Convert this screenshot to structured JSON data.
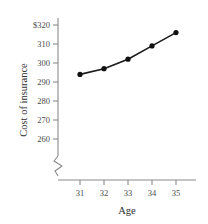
{
  "chart_data": {
    "type": "line",
    "title": "",
    "xlabel": "Age",
    "ylabel": "Cost of insurance",
    "x": [
      31,
      32,
      33,
      34,
      35
    ],
    "categories": [
      "31",
      "32",
      "33",
      "34",
      "35"
    ],
    "values": [
      294,
      297,
      302,
      309,
      316
    ],
    "series": [
      {
        "name": "Cost of insurance",
        "values": [
          294,
          297,
          302,
          309,
          316
        ]
      }
    ],
    "xtick_labels": [
      "31",
      "32",
      "33",
      "34",
      "35"
    ],
    "ytick_labels": [
      "$320",
      "310",
      "300",
      "290",
      "280",
      "270",
      "260"
    ],
    "ytick_values": [
      320,
      310,
      300,
      290,
      280,
      270,
      260
    ],
    "ylim": [
      255,
      324
    ],
    "xlim": [
      30.5,
      35.8
    ],
    "axis_break": true,
    "grid": false,
    "legend": false,
    "marker": "filled-circle",
    "line_color": "#1a1a1a",
    "marker_color": "#111111",
    "axis_color": "#8a8a8a",
    "text_color": "#4a4a4a",
    "background": "#ffffff"
  },
  "axes": {
    "x_title": "Age",
    "y_title": "Cost of insurance"
  }
}
